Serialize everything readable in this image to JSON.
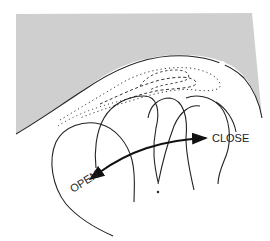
{
  "diagram": {
    "labels": {
      "open": "OPEN",
      "close": "CLOSE"
    },
    "colors": {
      "shaded_region": "#cfcfcf",
      "line": "#222222",
      "background": "#ffffff"
    },
    "arrow": {
      "direction": "bidirectional",
      "from_label": "OPEN",
      "to_label": "CLOSE"
    }
  }
}
